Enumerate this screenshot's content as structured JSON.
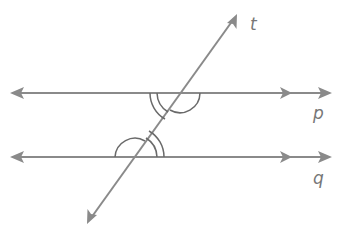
{
  "diagram": {
    "stroke_color": "#8a8a8a",
    "arc_color": "#6a6a6a",
    "label_color": "#777777",
    "labels": {
      "transversal": "t",
      "line_top": "p",
      "line_bottom": "q"
    },
    "lines": [
      {
        "name": "p",
        "y": 93,
        "x1": 10,
        "x2": 330,
        "parallel_marker_x": 287
      },
      {
        "name": "q",
        "y": 157,
        "x1": 10,
        "x2": 330,
        "parallel_marker_x": 287
      }
    ],
    "transversal": {
      "name": "t",
      "x1": 237,
      "y1": 14,
      "x2": 87,
      "y2": 224
    },
    "angle_marks": [
      {
        "at": "p",
        "type": "double-arc",
        "position": "lower-left"
      },
      {
        "at": "p",
        "type": "single-arc",
        "position": "lower-right"
      },
      {
        "at": "q",
        "type": "single-arc",
        "position": "upper-left"
      },
      {
        "at": "q",
        "type": "double-arc",
        "position": "upper-right"
      }
    ]
  }
}
